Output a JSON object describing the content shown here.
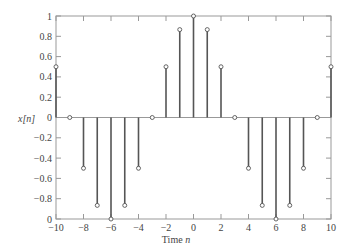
{
  "chart_data": {
    "type": "stem",
    "title": "",
    "xlabel": "Time n",
    "ylabel": "x[n]",
    "xlim": [
      -10,
      10
    ],
    "ylim": [
      -1,
      1
    ],
    "grid": false,
    "legend": null,
    "x": [
      -10,
      -9,
      -8,
      -7,
      -6,
      -5,
      -4,
      -3,
      -2,
      -1,
      0,
      1,
      2,
      3,
      4,
      5,
      6,
      7,
      8,
      9,
      10
    ],
    "values": [
      0.5,
      0,
      -0.5,
      -0.866,
      -1,
      -0.866,
      -0.5,
      0,
      0.5,
      0.866,
      1,
      0.866,
      0.5,
      0,
      -0.5,
      -0.866,
      -1,
      -0.866,
      -0.5,
      0,
      0.5
    ],
    "xticks": [
      "-10",
      "-8",
      "-6",
      "-4",
      "-2",
      "0",
      "2",
      "4",
      "6",
      "8",
      "10"
    ],
    "xtick_values": [
      -10,
      -8,
      -6,
      -4,
      -2,
      0,
      2,
      4,
      6,
      8,
      10
    ],
    "yticks": [
      "1",
      "0.8",
      "0.6",
      "0.4",
      "0.2",
      "0",
      "-0.2",
      "-0.4",
      "-0.6",
      "-0.8",
      "0"
    ],
    "ytick_values": [
      1,
      0.8,
      0.6,
      0.4,
      0.2,
      0,
      -0.2,
      -0.4,
      -0.6,
      -0.8,
      -1
    ]
  },
  "labels": {
    "xlabel_text": "Time ",
    "xlabel_var": "n",
    "ylabel_text": "x[n]"
  },
  "style": {
    "stem_color": "#555555",
    "axis_color": "#999999",
    "marker_fill": "#ffffff"
  }
}
